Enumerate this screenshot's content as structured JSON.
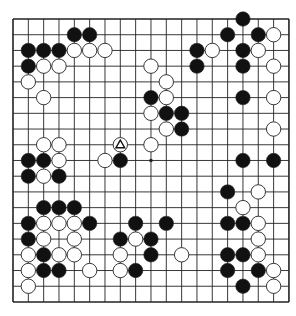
{
  "board": {
    "size": 19,
    "origin": {
      "x": 13,
      "y": 19
    },
    "spacing": {
      "x": 15.33,
      "y": 15.72
    },
    "line_color": "#222222",
    "stone_radius": 7.2,
    "colors": {
      "black": "#111111",
      "white": "#ffffff",
      "stone_outline": "#222222"
    },
    "star_points_visible": [
      [
        9,
        9
      ]
    ],
    "marker": {
      "col": 7,
      "row": 8,
      "shape": "triangle",
      "on": "white"
    }
  },
  "stones": [
    {
      "c": 15,
      "r": 0,
      "s": "B"
    },
    {
      "c": 4,
      "r": 1,
      "s": "B"
    },
    {
      "c": 5,
      "r": 1,
      "s": "B"
    },
    {
      "c": 14,
      "r": 1,
      "s": "B"
    },
    {
      "c": 16,
      "r": 1,
      "s": "B"
    },
    {
      "c": 17,
      "r": 1,
      "s": "W"
    },
    {
      "c": 1,
      "r": 2,
      "s": "B"
    },
    {
      "c": 2,
      "r": 2,
      "s": "B"
    },
    {
      "c": 3,
      "r": 2,
      "s": "B"
    },
    {
      "c": 4,
      "r": 2,
      "s": "W"
    },
    {
      "c": 5,
      "r": 2,
      "s": "W"
    },
    {
      "c": 6,
      "r": 2,
      "s": "W"
    },
    {
      "c": 12,
      "r": 2,
      "s": "B"
    },
    {
      "c": 13,
      "r": 2,
      "s": "W"
    },
    {
      "c": 15,
      "r": 2,
      "s": "B"
    },
    {
      "c": 16,
      "r": 2,
      "s": "W"
    },
    {
      "c": 1,
      "r": 3,
      "s": "B"
    },
    {
      "c": 2,
      "r": 3,
      "s": "W"
    },
    {
      "c": 3,
      "r": 3,
      "s": "W"
    },
    {
      "c": 9,
      "r": 3,
      "s": "W"
    },
    {
      "c": 12,
      "r": 3,
      "s": "B"
    },
    {
      "c": 15,
      "r": 3,
      "s": "B"
    },
    {
      "c": 17,
      "r": 3,
      "s": "W"
    },
    {
      "c": 1,
      "r": 4,
      "s": "W"
    },
    {
      "c": 10,
      "r": 4,
      "s": "W"
    },
    {
      "c": 2,
      "r": 5,
      "s": "W"
    },
    {
      "c": 9,
      "r": 5,
      "s": "B"
    },
    {
      "c": 10,
      "r": 5,
      "s": "W"
    },
    {
      "c": 15,
      "r": 5,
      "s": "B"
    },
    {
      "c": 17,
      "r": 5,
      "s": "W"
    },
    {
      "c": 9,
      "r": 6,
      "s": "W"
    },
    {
      "c": 10,
      "r": 6,
      "s": "B"
    },
    {
      "c": 11,
      "r": 6,
      "s": "B"
    },
    {
      "c": 10,
      "r": 7,
      "s": "W"
    },
    {
      "c": 11,
      "r": 7,
      "s": "B"
    },
    {
      "c": 17,
      "r": 7,
      "s": "W"
    },
    {
      "c": 2,
      "r": 8,
      "s": "W"
    },
    {
      "c": 3,
      "r": 8,
      "s": "W"
    },
    {
      "c": 7,
      "r": 8,
      "s": "W"
    },
    {
      "c": 9,
      "r": 8,
      "s": "W"
    },
    {
      "c": 1,
      "r": 9,
      "s": "B"
    },
    {
      "c": 2,
      "r": 9,
      "s": "B"
    },
    {
      "c": 3,
      "r": 9,
      "s": "W"
    },
    {
      "c": 6,
      "r": 9,
      "s": "W"
    },
    {
      "c": 7,
      "r": 9,
      "s": "B"
    },
    {
      "c": 15,
      "r": 9,
      "s": "B"
    },
    {
      "c": 17,
      "r": 9,
      "s": "B"
    },
    {
      "c": 1,
      "r": 10,
      "s": "B"
    },
    {
      "c": 2,
      "r": 10,
      "s": "W"
    },
    {
      "c": 3,
      "r": 10,
      "s": "B"
    },
    {
      "c": 14,
      "r": 11,
      "s": "B"
    },
    {
      "c": 16,
      "r": 11,
      "s": "W"
    },
    {
      "c": 2,
      "r": 12,
      "s": "B"
    },
    {
      "c": 3,
      "r": 12,
      "s": "B"
    },
    {
      "c": 4,
      "r": 12,
      "s": "B"
    },
    {
      "c": 15,
      "r": 12,
      "s": "W"
    },
    {
      "c": 1,
      "r": 13,
      "s": "B"
    },
    {
      "c": 2,
      "r": 13,
      "s": "W"
    },
    {
      "c": 3,
      "r": 13,
      "s": "W"
    },
    {
      "c": 4,
      "r": 13,
      "s": "W"
    },
    {
      "c": 5,
      "r": 13,
      "s": "B"
    },
    {
      "c": 8,
      "r": 13,
      "s": "B"
    },
    {
      "c": 10,
      "r": 13,
      "s": "B"
    },
    {
      "c": 14,
      "r": 13,
      "s": "B"
    },
    {
      "c": 15,
      "r": 13,
      "s": "B"
    },
    {
      "c": 16,
      "r": 13,
      "s": "W"
    },
    {
      "c": 1,
      "r": 14,
      "s": "B"
    },
    {
      "c": 2,
      "r": 14,
      "s": "W"
    },
    {
      "c": 4,
      "r": 14,
      "s": "W"
    },
    {
      "c": 7,
      "r": 14,
      "s": "B"
    },
    {
      "c": 8,
      "r": 14,
      "s": "W"
    },
    {
      "c": 9,
      "r": 14,
      "s": "B"
    },
    {
      "c": 16,
      "r": 14,
      "s": "W"
    },
    {
      "c": 1,
      "r": 15,
      "s": "W"
    },
    {
      "c": 2,
      "r": 15,
      "s": "B"
    },
    {
      "c": 3,
      "r": 15,
      "s": "W"
    },
    {
      "c": 4,
      "r": 15,
      "s": "W"
    },
    {
      "c": 7,
      "r": 15,
      "s": "W"
    },
    {
      "c": 9,
      "r": 15,
      "s": "B"
    },
    {
      "c": 11,
      "r": 15,
      "s": "W"
    },
    {
      "c": 14,
      "r": 15,
      "s": "B"
    },
    {
      "c": 15,
      "r": 15,
      "s": "B"
    },
    {
      "c": 16,
      "r": 15,
      "s": "W"
    },
    {
      "c": 1,
      "r": 16,
      "s": "W"
    },
    {
      "c": 2,
      "r": 16,
      "s": "B"
    },
    {
      "c": 3,
      "r": 16,
      "s": "B"
    },
    {
      "c": 5,
      "r": 16,
      "s": "W"
    },
    {
      "c": 7,
      "r": 16,
      "s": "W"
    },
    {
      "c": 8,
      "r": 16,
      "s": "B"
    },
    {
      "c": 14,
      "r": 16,
      "s": "B"
    },
    {
      "c": 16,
      "r": 16,
      "s": "B"
    },
    {
      "c": 17,
      "r": 16,
      "s": "W"
    },
    {
      "c": 1,
      "r": 17,
      "s": "W"
    },
    {
      "c": 15,
      "r": 17,
      "s": "B"
    },
    {
      "c": 17,
      "r": 17,
      "s": "W"
    }
  ]
}
